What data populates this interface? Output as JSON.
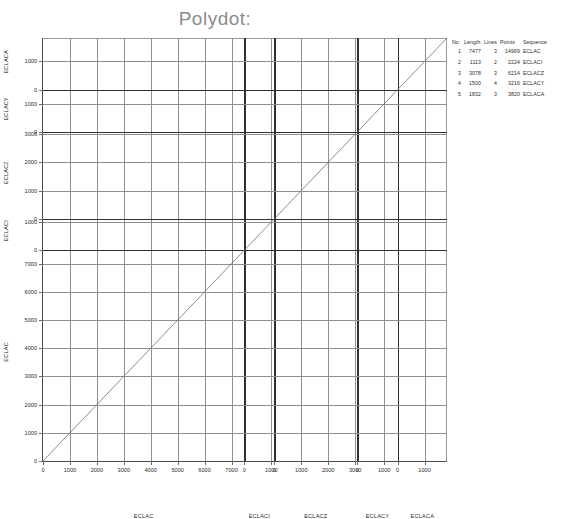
{
  "title": "Polydot:",
  "legend": {
    "headers": [
      "No.",
      "Length",
      "Lines",
      "Points",
      "Sequence"
    ],
    "rows": [
      {
        "no": "1",
        "length": "7477",
        "lines": "3",
        "points": "14969",
        "sequence": "ECLAC"
      },
      {
        "no": "2",
        "length": "1113",
        "lines": "2",
        "points": "2224",
        "sequence": "ECLACI"
      },
      {
        "no": "3",
        "length": "3078",
        "lines": "3",
        "points": "6214",
        "sequence": "ECLACZ"
      },
      {
        "no": "4",
        "length": "1500",
        "lines": "4",
        "points": "3216",
        "sequence": "ECLACY"
      },
      {
        "no": "5",
        "length": "1832",
        "lines": "3",
        "points": "3820",
        "sequence": "ECLACA"
      }
    ]
  },
  "chart_data": {
    "type": "scatter",
    "title": "Polydot:",
    "xlabel": "",
    "ylabel": "",
    "grid": true,
    "legend_position": "right",
    "sequences": [
      {
        "name": "ECLAC",
        "length": 7477,
        "lines": 3,
        "points": 14969
      },
      {
        "name": "ECLACI",
        "length": 1113,
        "lines": 2,
        "points": 2224
      },
      {
        "name": "ECLACZ",
        "length": 3078,
        "lines": 3,
        "points": 6214
      },
      {
        "name": "ECLACY",
        "length": 1500,
        "lines": 4,
        "points": 3216
      },
      {
        "name": "ECLACA",
        "length": 1832,
        "lines": 3,
        "points": 3820
      }
    ],
    "x_panels": [
      {
        "name": "ECLAC",
        "ticks": [
          0,
          1000,
          2000,
          3000,
          4000,
          5000,
          6000,
          7000
        ]
      },
      {
        "name": "ECLACI",
        "ticks": [
          0,
          1000
        ]
      },
      {
        "name": "ECLACZ",
        "ticks": [
          0,
          1000,
          2000,
          3000
        ]
      },
      {
        "name": "ECLACY",
        "ticks": [
          0,
          1000
        ]
      },
      {
        "name": "ECLACA",
        "ticks": [
          0,
          1000
        ]
      }
    ],
    "y_panels": [
      {
        "name": "ECLACA",
        "ticks": [
          1000,
          0
        ]
      },
      {
        "name": "ECLACY",
        "ticks": [
          1000,
          0
        ]
      },
      {
        "name": "ECLACZ",
        "ticks": [
          3000,
          2000,
          1000,
          0
        ]
      },
      {
        "name": "ECLACI",
        "ticks": [
          1000,
          0
        ]
      },
      {
        "name": "ECLAC",
        "ticks": [
          7000,
          6000,
          5000,
          4000,
          3000,
          2000,
          1000,
          0
        ]
      }
    ],
    "x_tick_labels": [
      "0",
      "1000",
      "2000",
      "3000",
      "4000",
      "5000",
      "6000",
      "7000",
      "0",
      "1000",
      "0",
      "1000",
      "2000",
      "3000",
      "0",
      "1000",
      "0",
      "1000"
    ],
    "y_tick_labels": [
      "1000",
      "0",
      "1000",
      "3000",
      "2000",
      "1000",
      "1000",
      "0",
      "7000",
      "6000",
      "5000",
      "4000",
      "3000",
      "2000",
      "1000",
      "0"
    ],
    "diagonals": [
      {
        "x_sequence": "ECLAC",
        "y_sequence": "ECLAC"
      },
      {
        "x_sequence": "ECLACI",
        "y_sequence": "ECLACI"
      },
      {
        "x_sequence": "ECLACZ",
        "y_sequence": "ECLACZ"
      },
      {
        "x_sequence": "ECLACY",
        "y_sequence": "ECLACY"
      },
      {
        "x_sequence": "ECLACA",
        "y_sequence": "ECLACA"
      }
    ]
  },
  "colors": {
    "title": "#8c8c8c",
    "separator": "#2f2f2f",
    "grid": "#8e8e8e",
    "diagonal": "#6f6f6f",
    "text": "#2b2b2b",
    "background": "#ffffff"
  }
}
